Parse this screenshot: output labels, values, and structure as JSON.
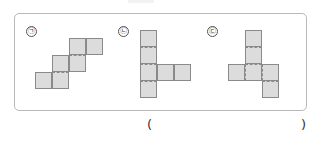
{
  "figures": [
    {
      "label": "㉠",
      "name": "figure-giyeok"
    },
    {
      "label": "㉡",
      "name": "figure-nieun"
    },
    {
      "label": "㉢",
      "name": "figure-digeut"
    }
  ],
  "answer": {
    "open": "(",
    "close": ")"
  },
  "colors": {
    "square_fill": "#dcdcdc",
    "square_border": "#8a8a8a",
    "frame_border": "#b9b9b9"
  }
}
